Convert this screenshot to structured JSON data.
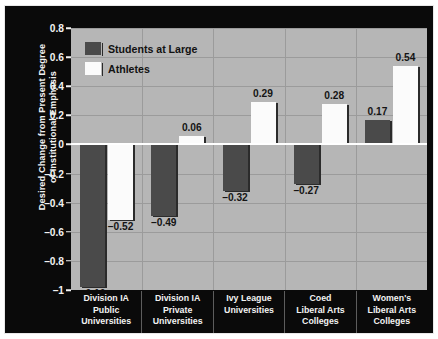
{
  "chart_data": {
    "type": "bar",
    "title": "",
    "xlabel": "",
    "ylabel_lines": [
      "Desired Change from Present Degree",
      "of Institutional Emphasis"
    ],
    "categories": [
      [
        "Division IA",
        "Public",
        "Universities"
      ],
      [
        "Division IA",
        "Private",
        "Universities"
      ],
      [
        "Ivy League",
        "Universities"
      ],
      [
        "Coed",
        "Liberal Arts",
        "Colleges"
      ],
      [
        "Women's",
        "Liberal Arts",
        "Colleges"
      ]
    ],
    "series": [
      {
        "name": "Students at Large",
        "color": "#4a4a4a",
        "values": [
          -0.98,
          -0.49,
          -0.32,
          -0.27,
          0.17
        ],
        "labels": [
          "-0.10",
          "-0.49",
          "-0.32",
          "-0.27",
          "0.17"
        ]
      },
      {
        "name": "Athletes",
        "color": "#fbfbfb",
        "values": [
          -0.52,
          0.06,
          0.29,
          0.28,
          0.54
        ],
        "labels": [
          "-0.52",
          "0.06",
          "0.29",
          "0.28",
          "0.54"
        ]
      }
    ],
    "ylim": [
      -1.0,
      0.8
    ],
    "yticks": [
      0.8,
      0.6,
      0.4,
      0.2,
      0,
      -0.2,
      -0.4,
      -0.6,
      -0.8,
      -1
    ],
    "ytick_labels": [
      "0.8",
      "0.6",
      "0.4",
      "0.2",
      "0",
      "-0.2",
      "-0.4",
      "-0.6",
      "-0.8",
      "-1"
    ],
    "grid": true,
    "legend_position": "top-left",
    "background_color": "#0a0a0a",
    "plot_background_color": "#b6b6b6",
    "gridline_color": "#9b9b9b",
    "zeroline_color": "#ffffff",
    "axis_text_color": "#f2f2f2"
  }
}
